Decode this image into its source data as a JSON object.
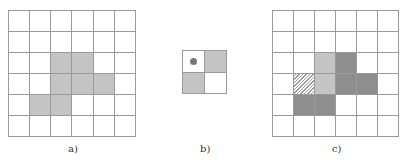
{
  "figure": {
    "panels": [
      {
        "id": "a",
        "label": "a)",
        "rows": 6,
        "cols": 6,
        "cells": [
          [
            "w",
            "w",
            "w",
            "w",
            "w",
            "w"
          ],
          [
            "w",
            "w",
            "w",
            "w",
            "w",
            "w"
          ],
          [
            "w",
            "w",
            "light",
            "light",
            "w",
            "w"
          ],
          [
            "w",
            "w",
            "light",
            "light",
            "light",
            "w"
          ],
          [
            "w",
            "light",
            "light",
            "w",
            "w",
            "w"
          ],
          [
            "w",
            "w",
            "w",
            "w",
            "w",
            "w"
          ]
        ]
      },
      {
        "id": "b",
        "label": "b)",
        "rows": 2,
        "cols": 2,
        "cells": [
          [
            "dot",
            "light"
          ],
          [
            "light",
            "w"
          ]
        ]
      },
      {
        "id": "c",
        "label": "c)",
        "rows": 6,
        "cols": 6,
        "cells": [
          [
            "w",
            "w",
            "w",
            "w",
            "w",
            "w"
          ],
          [
            "w",
            "w",
            "w",
            "w",
            "w",
            "w"
          ],
          [
            "w",
            "w",
            "light",
            "dark",
            "w",
            "w"
          ],
          [
            "w",
            "hatch",
            "light",
            "dark",
            "dark",
            "w"
          ],
          [
            "w",
            "dark",
            "dark",
            "w",
            "w",
            "w"
          ],
          [
            "w",
            "w",
            "w",
            "w",
            "w",
            "w"
          ]
        ]
      }
    ],
    "colors": {
      "grid_line": "#9a9a9a",
      "light_fill": "#c4c4c4",
      "dark_fill": "#8e8e8e",
      "dot": "#777777"
    }
  }
}
